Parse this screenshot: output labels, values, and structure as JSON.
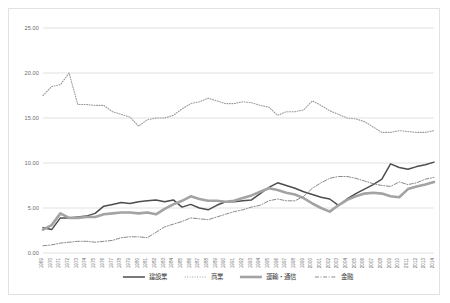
{
  "chart_data": {
    "type": "line",
    "title": "",
    "xlabel": "",
    "ylabel": "",
    "ylim": [
      0,
      25
    ],
    "yticks": [
      "0.00",
      "5.00",
      "10.00",
      "15.00",
      "20.00",
      "25.00"
    ],
    "grid": true,
    "legend_position": "bottom",
    "categories": [
      "1969",
      "1970",
      "1971",
      "1972",
      "1973",
      "1974",
      "1975",
      "1976",
      "1977",
      "1978",
      "1979",
      "1980",
      "1981",
      "1982",
      "1983",
      "1984",
      "1985",
      "1986",
      "1987",
      "1988",
      "1989",
      "1990",
      "1991",
      "1992",
      "1993",
      "1994",
      "1995",
      "1996",
      "1997",
      "1998",
      "1999",
      "2000",
      "2001",
      "2002",
      "2003",
      "2004",
      "2005",
      "2006",
      "2007",
      "2008",
      "2009",
      "2010",
      "2011",
      "2012",
      "2013",
      "2014"
    ],
    "series": [
      {
        "name": "建設業",
        "style": "solid",
        "color": "#4d4d4d",
        "width": 1.5,
        "values": [
          2.8,
          2.6,
          3.9,
          3.9,
          4.0,
          4.1,
          4.4,
          5.2,
          5.4,
          5.6,
          5.5,
          5.7,
          5.8,
          5.9,
          5.7,
          5.9,
          5.1,
          5.4,
          5.0,
          4.8,
          5.3,
          5.7,
          5.7,
          5.8,
          5.9,
          6.6,
          7.3,
          7.8,
          7.5,
          7.2,
          6.8,
          6.5,
          6.2,
          6.0,
          5.3,
          6.0,
          6.6,
          7.1,
          7.6,
          8.2,
          9.9,
          9.5,
          9.3,
          9.6,
          9.8,
          10.1
        ]
      },
      {
        "name": "商業",
        "style": "dotted",
        "color": "#9a9a9a",
        "width": 1.1,
        "values": [
          17.5,
          18.5,
          18.7,
          20.0,
          16.5,
          16.5,
          16.4,
          16.4,
          15.7,
          15.4,
          15.1,
          14.1,
          14.8,
          15.0,
          15.0,
          15.3,
          16.0,
          16.6,
          16.8,
          17.2,
          16.9,
          16.6,
          16.6,
          16.8,
          16.7,
          16.4,
          16.2,
          15.3,
          15.7,
          15.7,
          15.9,
          16.9,
          16.4,
          15.8,
          15.4,
          15.0,
          14.9,
          14.6,
          14.0,
          13.4,
          13.4,
          13.6,
          13.5,
          13.4,
          13.4,
          13.6
        ]
      },
      {
        "name": "運輸・通信",
        "style": "solid",
        "color": "#a3a3a3",
        "width": 2.6,
        "values": [
          2.6,
          3.1,
          4.4,
          3.9,
          3.9,
          4.0,
          4.0,
          4.3,
          4.4,
          4.5,
          4.5,
          4.4,
          4.5,
          4.3,
          4.9,
          5.4,
          5.8,
          6.3,
          6.0,
          5.8,
          5.8,
          5.7,
          5.8,
          6.1,
          6.4,
          6.8,
          7.2,
          7.0,
          6.7,
          6.5,
          6.1,
          5.5,
          5.0,
          4.6,
          5.3,
          5.9,
          6.3,
          6.6,
          6.7,
          6.6,
          6.3,
          6.2,
          7.1,
          7.4,
          7.6,
          7.9
        ]
      },
      {
        "name": "金融",
        "style": "dashdot",
        "color": "#8a8a8a",
        "width": 1.0,
        "values": [
          0.8,
          0.9,
          1.1,
          1.2,
          1.3,
          1.3,
          1.2,
          1.3,
          1.4,
          1.7,
          1.8,
          1.8,
          1.7,
          2.3,
          2.9,
          3.2,
          3.5,
          3.9,
          3.8,
          3.7,
          4.0,
          4.3,
          4.6,
          4.8,
          5.1,
          5.3,
          5.8,
          6.0,
          5.8,
          5.8,
          6.3,
          7.2,
          7.8,
          8.3,
          8.5,
          8.5,
          8.3,
          8.0,
          7.7,
          7.5,
          7.4,
          7.9,
          7.6,
          7.8,
          8.2,
          8.4
        ]
      }
    ]
  }
}
